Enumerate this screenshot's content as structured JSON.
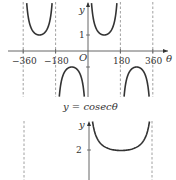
{
  "chart_data": [
    {
      "type": "line",
      "title": "",
      "function": "y = cosec(theta)",
      "xlabel": "θ",
      "ylabel": "y",
      "xlim": [
        -430,
        430
      ],
      "ylim": [
        -3,
        3.2
      ],
      "origin_label": "O",
      "x_ticks": [
        {
          "value": -360,
          "label": "−360"
        },
        {
          "value": -180,
          "label": "−180"
        },
        {
          "value": 180,
          "label": "180"
        },
        {
          "value": 360,
          "label": "360"
        }
      ],
      "y_ticks": [
        {
          "value": 1,
          "label": "1"
        },
        {
          "value": -1,
          "label": ""
        }
      ],
      "asymptotes": [
        -360,
        -180,
        0,
        180,
        360
      ],
      "series": [
        {
          "name": "cosec θ branch 1",
          "domain": [
            -360,
            -180
          ]
        },
        {
          "name": "cosec θ branch 2",
          "domain": [
            -180,
            0
          ]
        },
        {
          "name": "cosec θ branch 3",
          "domain": [
            0,
            180
          ]
        },
        {
          "name": "cosec θ branch 4",
          "domain": [
            180,
            360
          ]
        }
      ],
      "grid": false
    },
    {
      "type": "line",
      "caption": "y = cosecθ",
      "xlabel": "",
      "ylabel": "y",
      "y_ticks": [
        {
          "value": 2,
          "label": "2"
        }
      ],
      "asymptotes": [
        -360,
        360
      ],
      "series": [
        {
          "name": "U-shaped curve",
          "domain": [
            0,
            360
          ],
          "minimum": 2
        }
      ],
      "grid": false
    }
  ],
  "labels": {
    "caption": "y = cosecθ",
    "y_axis": "y",
    "x_axis": "θ",
    "origin": "O",
    "tick_neg360": "−360",
    "tick_neg180": "−180",
    "tick_180": "180",
    "tick_360": "360",
    "tick_y1": "1",
    "tick_y2": "2"
  }
}
